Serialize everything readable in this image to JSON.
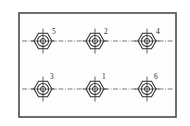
{
  "drawing": {
    "title": "Bolt hole pattern plate",
    "background_color": "#ffffff",
    "border_color": "#4a4a4a",
    "line_color": "#2e2e2e",
    "centerline_color": "#555555",
    "label_color": "#1f1f1f",
    "plate": {
      "x": 19,
      "y": 13,
      "width": 157,
      "height": 104
    },
    "rows": [
      {
        "name": "upper-row",
        "centerline_y": 41,
        "centerline_x_start": 22,
        "centerline_x_end": 173
      },
      {
        "name": "lower-row",
        "centerline_y": 89,
        "centerline_x_start": 22,
        "centerline_x_end": 173
      }
    ],
    "bolts": [
      {
        "id": "bolt-5",
        "label": "5",
        "cx": 43,
        "cy": 41,
        "row": "upper-row",
        "label_dx": 9,
        "label_dy": -7
      },
      {
        "id": "bolt-2",
        "label": "2",
        "cx": 95,
        "cy": 41,
        "row": "upper-row",
        "label_dx": 9,
        "label_dy": -7
      },
      {
        "id": "bolt-4",
        "label": "4",
        "cx": 147,
        "cy": 41,
        "row": "upper-row",
        "label_dx": 9,
        "label_dy": -7
      },
      {
        "id": "bolt-3",
        "label": "3",
        "cx": 43,
        "cy": 89,
        "row": "lower-row",
        "label_dx": 7,
        "label_dy": -10
      },
      {
        "id": "bolt-1",
        "label": "1",
        "cx": 95,
        "cy": 89,
        "row": "lower-row",
        "label_dx": 7,
        "label_dy": -10
      },
      {
        "id": "bolt-6",
        "label": "6",
        "cx": 147,
        "cy": 89,
        "row": "lower-row",
        "label_dx": 7,
        "label_dy": -10
      }
    ],
    "bolt_geometry": {
      "hex_radius": 9,
      "circle_outer_radius": 5.6,
      "circle_inner_radius": 2.6,
      "axis_extend": 12.5
    }
  }
}
